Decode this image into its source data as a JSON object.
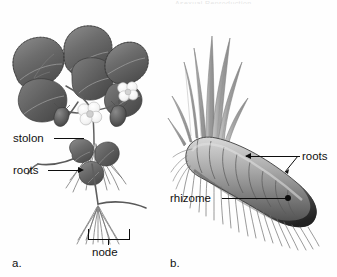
{
  "figure": {
    "header_remnant": "Asexual Reproduction",
    "background_color": "#fefefe",
    "ink_color": "#0d0d0d",
    "width": 337,
    "height": 277
  },
  "panels": [
    {
      "letter": "a.",
      "subject": "strawberry-plant-with-stolon",
      "description": "Grayscale botanical drawing of a strawberry plant with trifoliate serrated leaves, white flowers, berries, a horizontal stolon running to a daughter plantlet, and fibrous roots."
    },
    {
      "letter": "b.",
      "subject": "iris-rhizome",
      "description": "Grayscale botanical drawing of a segmented iris rhizome lying horizontally with a fan of sword-shaped leaves at the left end and fibrous roots hanging beneath."
    }
  ],
  "labels": {
    "stolon": "stolon",
    "roots_left": "roots",
    "node": "node",
    "roots_right": "roots",
    "rhizome": "rhizome"
  }
}
